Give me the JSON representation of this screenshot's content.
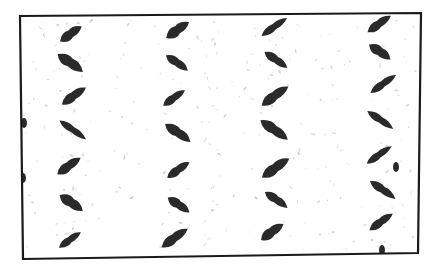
{
  "image": {
    "description": "Black and white texture of a diamond/tread plate pattern with zigzag dark marks inside a slightly tilted black rectangular border",
    "background": "#ffffff",
    "border_color": "#1a1a1a",
    "mark_color": "#2a2a2a",
    "speckle_color": "#b8b8b8",
    "frame": {
      "tl": [
        20,
        16
      ],
      "tr": [
        421,
        13
      ],
      "br": [
        418,
        253
      ],
      "bl": [
        23,
        259
      ]
    },
    "columns": [
      {
        "x": 72,
        "marks": [
          {
            "y": 34,
            "dir": "up"
          },
          {
            "y": 63,
            "dir": "down"
          },
          {
            "y": 96,
            "dir": "up"
          },
          {
            "y": 130,
            "dir": "down"
          },
          {
            "y": 166,
            "dir": "up"
          },
          {
            "y": 203,
            "dir": "down"
          },
          {
            "y": 240,
            "dir": "up"
          }
        ]
      },
      {
        "x": 176,
        "marks": [
          {
            "y": 30,
            "dir": "up"
          },
          {
            "y": 63,
            "dir": "down"
          },
          {
            "y": 98,
            "dir": "up"
          },
          {
            "y": 133,
            "dir": "down"
          },
          {
            "y": 170,
            "dir": "up"
          },
          {
            "y": 205,
            "dir": "down"
          },
          {
            "y": 238,
            "dir": "up"
          }
        ]
      },
      {
        "x": 275,
        "marks": [
          {
            "y": 27,
            "dir": "up"
          },
          {
            "y": 60,
            "dir": "down"
          },
          {
            "y": 96,
            "dir": "up"
          },
          {
            "y": 130,
            "dir": "down"
          },
          {
            "y": 168,
            "dir": "up"
          },
          {
            "y": 200,
            "dir": "down"
          },
          {
            "y": 232,
            "dir": "up"
          }
        ]
      },
      {
        "x": 382,
        "marks": [
          {
            "y": 24,
            "dir": "up"
          },
          {
            "y": 52,
            "dir": "down"
          },
          {
            "y": 84,
            "dir": "up"
          },
          {
            "y": 120,
            "dir": "down"
          },
          {
            "y": 155,
            "dir": "up"
          },
          {
            "y": 190,
            "dir": "down"
          },
          {
            "y": 222,
            "dir": "up"
          }
        ]
      }
    ]
  }
}
